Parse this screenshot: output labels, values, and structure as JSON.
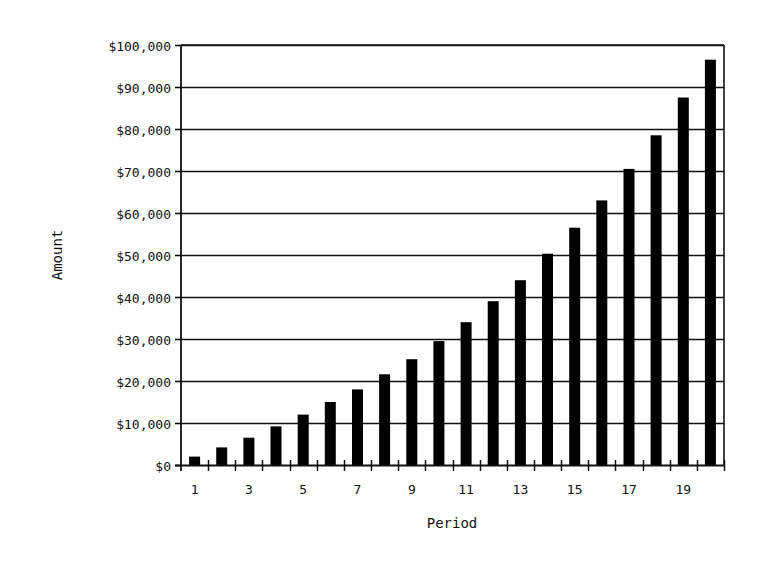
{
  "chart_data": {
    "type": "bar",
    "title": "",
    "xlabel": "Period",
    "ylabel": "Amount",
    "categories": [
      1,
      2,
      3,
      4,
      5,
      6,
      7,
      8,
      9,
      10,
      11,
      12,
      13,
      14,
      15,
      16,
      17,
      18,
      19,
      20
    ],
    "x_tick_labels": [
      "1",
      "3",
      "5",
      "7",
      "9",
      "11",
      "13",
      "15",
      "17",
      "19"
    ],
    "y_tick_labels": [
      "$0",
      "$10,000",
      "$20,000",
      "$30,000",
      "$40,000",
      "$50,000",
      "$60,000",
      "$70,000",
      "$80,000",
      "$90,000",
      "$100,000"
    ],
    "series": [
      {
        "name": "Amount",
        "color": "#000000",
        "values": [
          2000,
          4200,
          6500,
          9200,
          12000,
          15000,
          18000,
          21600,
          25200,
          29500,
          34000,
          39000,
          44000,
          50300,
          56500,
          63000,
          70500,
          78500,
          87500,
          96500
        ]
      }
    ],
    "ylim": [
      0,
      100000
    ],
    "y_step": 10000,
    "grid": true,
    "legend": "none"
  },
  "colors": {
    "bar": "#000000",
    "grid": "#111111",
    "background": "#ffffff"
  }
}
